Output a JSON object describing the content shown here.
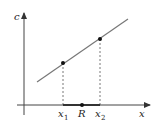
{
  "diagram": {
    "axes": {
      "x_label": "x",
      "y_label": "c"
    },
    "line": {
      "x1": 37,
      "y1": 82,
      "x2": 128,
      "y2": 19,
      "color": "#777777"
    },
    "points": [
      {
        "name": "x",
        "sub": "1",
        "px": 63,
        "py": 63
      },
      {
        "name": "x",
        "sub": "2",
        "px": 100,
        "py": 39
      }
    ],
    "interval": {
      "label": "R",
      "from": 63,
      "to": 100,
      "dot_x": 82
    },
    "colors": {
      "axis": "#444444",
      "line": "#777777",
      "interval": "#333333",
      "point": "#111111"
    }
  }
}
